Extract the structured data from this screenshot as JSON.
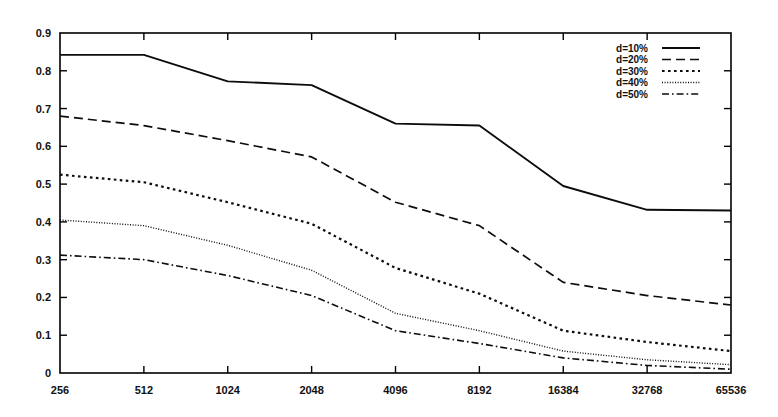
{
  "chart_data": {
    "type": "line",
    "title": "",
    "xlabel": "",
    "ylabel": "",
    "categories": [
      "256",
      "512",
      "1024",
      "2048",
      "4096",
      "8192",
      "16384",
      "32768",
      "65536"
    ],
    "x_tick_labels": [
      "256",
      "512",
      "1024",
      "2048",
      "4096",
      "8192",
      "16384",
      "32768",
      "65536"
    ],
    "y_tick_labels": [
      "0",
      "0.1",
      "0.2",
      "0.3",
      "0.4",
      "0.5",
      "0.6",
      "0.7",
      "0.8",
      "0.9"
    ],
    "y_tick_values": [
      0,
      0.1,
      0.2,
      0.3,
      0.4,
      0.5,
      0.6,
      0.7,
      0.8,
      0.9
    ],
    "ylim": [
      0,
      0.9
    ],
    "xscale": "categorical-log2",
    "grid": false,
    "legend_position": "top-right",
    "series": [
      {
        "name": "d=10%",
        "label": "d=10%",
        "linestyle": "solid",
        "dasharray": "",
        "width": 1.9,
        "values": [
          0.842,
          0.842,
          0.772,
          0.762,
          0.66,
          0.655,
          0.495,
          0.432,
          0.43
        ]
      },
      {
        "name": "d=20%",
        "label": "d=20%",
        "linestyle": "dashed",
        "dasharray": "9,5",
        "width": 1.7,
        "values": [
          0.68,
          0.655,
          0.615,
          0.572,
          0.452,
          0.39,
          0.24,
          0.205,
          0.18
        ]
      },
      {
        "name": "d=30%",
        "label": "d=30%",
        "linestyle": "dotted",
        "dasharray": "2.6,3.4",
        "width": 2.2,
        "values": [
          0.525,
          0.505,
          0.452,
          0.395,
          0.278,
          0.21,
          0.112,
          0.082,
          0.058
        ]
      },
      {
        "name": "d=40%",
        "label": "d=40%",
        "linestyle": "fine-dotted",
        "dasharray": "1,1.6",
        "width": 1.4,
        "values": [
          0.405,
          0.39,
          0.338,
          0.272,
          0.158,
          0.112,
          0.058,
          0.035,
          0.022
        ]
      },
      {
        "name": "d=50%",
        "label": "d=50%",
        "linestyle": "dash-dot",
        "dasharray": "7,3,1.6,3",
        "width": 1.6,
        "values": [
          0.312,
          0.3,
          0.258,
          0.205,
          0.112,
          0.078,
          0.04,
          0.02,
          0.01
        ]
      }
    ]
  },
  "legend": {
    "entries": [
      {
        "label": "d=10%"
      },
      {
        "label": "d=20%"
      },
      {
        "label": "d=30%"
      },
      {
        "label": "d=40%"
      },
      {
        "label": "d=50%"
      }
    ]
  },
  "colors": {
    "line": "#0d0d0d",
    "axis": "#000000",
    "background": "#ffffff",
    "text": "#111111"
  }
}
